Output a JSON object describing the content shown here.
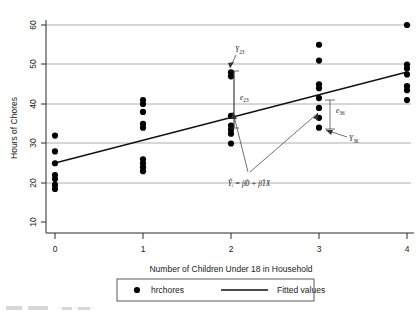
{
  "chart_data": {
    "type": "scatter",
    "title": "",
    "xlabel": "Number of Children Under 18 in Household",
    "ylabel": "Hours of Chores",
    "xlim": [
      -0.35,
      4.35
    ],
    "ylim": [
      8,
      62
    ],
    "xticks": [
      "0",
      "1",
      "2",
      "3",
      "4"
    ],
    "xtick_values": [
      0,
      1,
      2,
      3,
      4
    ],
    "yticks": [
      "10",
      "20",
      "30",
      "40",
      "50",
      "60"
    ],
    "ytick_values": [
      10,
      20,
      30,
      40,
      50,
      60
    ],
    "grid": "horizontal",
    "legend_position": "below-axis",
    "series": [
      {
        "name": "hrchores",
        "marker": "filled-circle",
        "color": "#000000",
        "points": [
          {
            "x": 0,
            "y": 32
          },
          {
            "x": 0,
            "y": 28
          },
          {
            "x": 0,
            "y": 25
          },
          {
            "x": 0,
            "y": 22
          },
          {
            "x": 0,
            "y": 21
          },
          {
            "x": 0,
            "y": 19.5
          },
          {
            "x": 0,
            "y": 18.5
          },
          {
            "x": 1,
            "y": 41
          },
          {
            "x": 1,
            "y": 40
          },
          {
            "x": 1,
            "y": 38
          },
          {
            "x": 1,
            "y": 35
          },
          {
            "x": 1,
            "y": 34
          },
          {
            "x": 1,
            "y": 26
          },
          {
            "x": 1,
            "y": 25
          },
          {
            "x": 1,
            "y": 24
          },
          {
            "x": 1,
            "y": 23
          },
          {
            "x": 2,
            "y": 48
          },
          {
            "x": 2,
            "y": 47
          },
          {
            "x": 2,
            "y": 37
          },
          {
            "x": 2,
            "y": 34.5
          },
          {
            "x": 2,
            "y": 33.5
          },
          {
            "x": 2,
            "y": 32.5
          },
          {
            "x": 2,
            "y": 30
          },
          {
            "x": 3,
            "y": 55
          },
          {
            "x": 3,
            "y": 51
          },
          {
            "x": 3,
            "y": 45
          },
          {
            "x": 3,
            "y": 44
          },
          {
            "x": 3,
            "y": 41.5
          },
          {
            "x": 3,
            "y": 39
          },
          {
            "x": 3,
            "y": 36.5
          },
          {
            "x": 3,
            "y": 34
          },
          {
            "x": 4,
            "y": 60
          },
          {
            "x": 4,
            "y": 50
          },
          {
            "x": 4,
            "y": 49
          },
          {
            "x": 4,
            "y": 47.5
          },
          {
            "x": 4,
            "y": 44.5
          },
          {
            "x": 4,
            "y": 43.5
          },
          {
            "x": 4,
            "y": 41
          }
        ]
      },
      {
        "name": "Fitted values",
        "marker": "line",
        "color": "#111111",
        "intercept": 23.0,
        "slope": 6.25,
        "endpoints": [
          {
            "x": 0,
            "y": 23.0
          },
          {
            "x": 4,
            "y": 48.0
          }
        ]
      }
    ],
    "annotations": [
      {
        "id": "y23",
        "label": "Y",
        "subscript": "23",
        "at": {
          "x": 2,
          "y": 47.5
        },
        "text_at": {
          "x": 2.02,
          "y": 54.5
        }
      },
      {
        "id": "e23",
        "label": "e",
        "subscript": "23",
        "at": {
          "x": 2,
          "y": 41
        },
        "text_at": {
          "x": 2.12,
          "y": 41
        }
      },
      {
        "id": "e36",
        "label": "e",
        "subscript": "36",
        "at": {
          "x": 3,
          "y": 40
        },
        "text_at": {
          "x": 3.2,
          "y": 41
        }
      },
      {
        "id": "y36",
        "label": "Y",
        "subscript": "36",
        "at": {
          "x": 3,
          "y": 34
        },
        "text_at": {
          "x": 3.35,
          "y": 31.5
        }
      },
      {
        "id": "equation",
        "label": "Ŷᵢ = β̂0 + β̂1X",
        "at": {
          "x": 2.5,
          "y": 42
        },
        "text_at": {
          "x": 2.35,
          "y": 19.5
        }
      }
    ],
    "legend": [
      {
        "label": "hrchores",
        "marker": "filled-circle"
      },
      {
        "label": "Fitted values",
        "marker": "line"
      }
    ]
  }
}
